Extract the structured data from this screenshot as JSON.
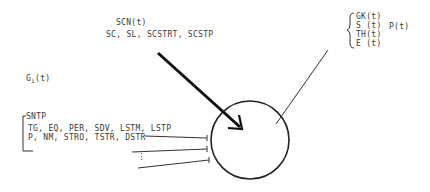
{
  "diagram": {
    "top_input": {
      "title": "SCN(t)",
      "params": "SC, SL, SCSTRT, SCSTP"
    },
    "left_input": {
      "title_main": "G",
      "title_sub": "i",
      "title_tail": "(t)",
      "group_label": "SNTP",
      "params_line1": "TG, EQ, PER, SDV, LSTM, LSTP",
      "params_line2": "P, NM, STRO, TSTR, DSTR",
      "ellipsis": "⋮"
    },
    "outputs": {
      "items": [
        "GK(t)",
        "S (t)",
        "TH(t)",
        "E (t)"
      ],
      "combined": "P(t)"
    }
  }
}
